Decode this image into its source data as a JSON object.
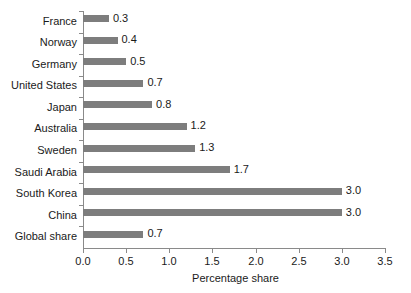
{
  "chart_data": {
    "type": "bar",
    "orientation": "horizontal",
    "title": "",
    "subtitle": "",
    "xlabel": "Percentage share",
    "ylabel": "",
    "xlim": [
      0.0,
      3.5
    ],
    "xticks": [
      "0.0",
      "0.5",
      "1.0",
      "1.5",
      "2.0",
      "2.5",
      "3.0",
      "3.5"
    ],
    "xtick_values": [
      0.0,
      0.5,
      1.0,
      1.5,
      2.0,
      2.5,
      3.0,
      3.5
    ],
    "grid": false,
    "legend": false,
    "legend_position": "none",
    "bar_color": "#7d7d7d",
    "axis_color": "#8a8a8a",
    "text_color": "#1a1a1a",
    "background_color": "#ffffff",
    "categories": [
      "France",
      "Norway",
      "Germany",
      "United States",
      "Japan",
      "Australia",
      "Sweden",
      "Saudi Arabia",
      "South Korea",
      "China",
      "Global share"
    ],
    "values": [
      0.3,
      0.4,
      0.5,
      0.7,
      0.8,
      1.2,
      1.3,
      1.7,
      3.0,
      3.0,
      0.7
    ],
    "data_labels": [
      "0.3",
      "0.4",
      "0.5",
      "0.7",
      "0.8",
      "1.2",
      "1.3",
      "1.7",
      "3.0",
      "3.0",
      "0.7"
    ]
  }
}
